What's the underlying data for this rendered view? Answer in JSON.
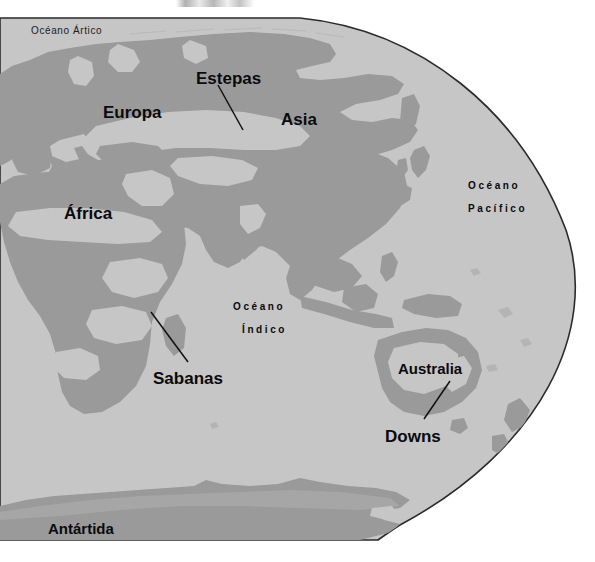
{
  "figure": {
    "type": "world-map-thematic",
    "title_visible": false,
    "projection": "globe-right-limb",
    "width": 595,
    "height": 562
  },
  "colors": {
    "page_background": "#ffffff",
    "ocean": "#c6c6c6",
    "land": "#9a9a9a",
    "land_light": "#b4b4b4",
    "globe_outline": "#2b2b2b",
    "label_text": "#0a0a0a",
    "leader_line": "#111111"
  },
  "labels": {
    "regions": [
      {
        "id": "europa",
        "text": "Europa",
        "x": 103,
        "y": 104,
        "size": "large"
      },
      {
        "id": "asia",
        "text": "Asia",
        "x": 281,
        "y": 111,
        "size": "large"
      },
      {
        "id": "africa",
        "text": "África",
        "x": 64,
        "y": 205,
        "size": "large"
      },
      {
        "id": "estepas",
        "text": "Estepas",
        "x": 196,
        "y": 70,
        "size": "large"
      },
      {
        "id": "sabanas",
        "text": "Sabanas",
        "x": 153,
        "y": 370,
        "size": "large"
      },
      {
        "id": "australia",
        "text": "Australia",
        "x": 398,
        "y": 361,
        "size": "medium"
      },
      {
        "id": "downs",
        "text": "Downs",
        "x": 385,
        "y": 428,
        "size": "large"
      },
      {
        "id": "antartida",
        "text": "Antártida",
        "x": 48,
        "y": 521,
        "size": "medium"
      }
    ],
    "oceans": [
      {
        "id": "oceano-artico",
        "line1": "Océano Ártico",
        "line2": "",
        "x": 31,
        "y": 26,
        "style": "arctic"
      },
      {
        "id": "oceano-pacifico",
        "line1": "Océano",
        "line2": "Pacífico",
        "x": 468,
        "y": 181,
        "style": "spaced"
      },
      {
        "id": "oceano-indico",
        "line1": "Océano",
        "line2": "Índico",
        "x": 233,
        "y": 302,
        "style": "spaced"
      }
    ],
    "leader_lines": [
      {
        "id": "leader-estepas",
        "from_x": 218,
        "from_y": 85,
        "to_x": 243,
        "to_y": 130
      },
      {
        "id": "leader-sabanas",
        "from_x": 188,
        "from_y": 362,
        "to_x": 151,
        "to_y": 312
      },
      {
        "id": "leader-downs",
        "from_x": 424,
        "from_y": 419,
        "to_x": 450,
        "to_y": 381
      }
    ]
  },
  "legend_note": {
    "shown": false,
    "meaning_dark": "land / vegetated continental mass",
    "meaning_light": "grassland, steppe and savanna belts"
  }
}
